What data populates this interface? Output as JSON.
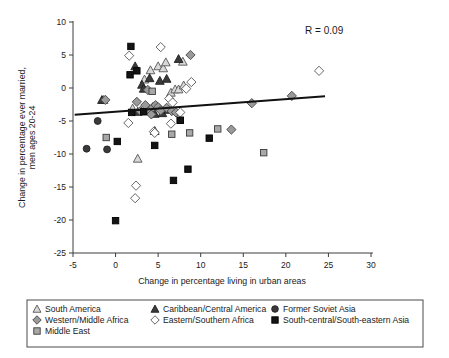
{
  "chart_data": {
    "type": "scatter",
    "title": "",
    "xlabel": "Change in percentage living in urban areas",
    "ylabel": "Change in percentage ever married, men ages 20-24",
    "xlim": [
      -5,
      30
    ],
    "ylim": [
      -25,
      10
    ],
    "xticks": [
      -5,
      0,
      5,
      10,
      15,
      20,
      25,
      30
    ],
    "yticks": [
      10,
      5,
      0,
      -5,
      -10,
      -15,
      -20,
      -25
    ],
    "xtick_labels": [
      "-5",
      "0",
      "5",
      "10",
      "15",
      "20",
      "25",
      "30"
    ],
    "ytick_labels": [
      "10",
      "5",
      "0",
      "-5",
      "-10",
      "-15",
      "-20",
      "-25"
    ],
    "grid": false,
    "legend_position": "below",
    "annotations": [
      {
        "text": "R = 0.09",
        "x": 24.5,
        "y": 8.2
      }
    ],
    "trendline": {
      "x_start": -4.8,
      "y_start": -4.05,
      "x_end": 24.6,
      "y_end": -1.25,
      "color": "#111111"
    },
    "series": [
      {
        "name": "South America",
        "marker": "triangle",
        "fill": "#d8d8d8",
        "edge": "#555555",
        "points": [
          {
            "x": -1.4,
            "y": -1.8
          },
          {
            "x": 2.0,
            "y": -3.1
          },
          {
            "x": 2.6,
            "y": -10.7
          },
          {
            "x": 3.0,
            "y": -3.5
          },
          {
            "x": 3.4,
            "y": 1.3
          },
          {
            "x": 4.1,
            "y": 2.7
          },
          {
            "x": 5.0,
            "y": 3.3
          },
          {
            "x": 5.6,
            "y": 3.0
          },
          {
            "x": 5.9,
            "y": 3.9
          },
          {
            "x": 6.5,
            "y": -0.7
          },
          {
            "x": 7.0,
            "y": -0.2
          },
          {
            "x": 7.4,
            "y": -0.2
          },
          {
            "x": 7.9,
            "y": 4.0
          },
          {
            "x": 8.0,
            "y": 0.4
          }
        ]
      },
      {
        "name": "Caribbean/Central America",
        "marker": "triangle",
        "fill": "#3a3a3a",
        "edge": "#222222",
        "points": [
          {
            "x": -1.6,
            "y": -1.8
          },
          {
            "x": 2.3,
            "y": 3.3
          },
          {
            "x": 2.6,
            "y": -3.6
          },
          {
            "x": 3.1,
            "y": 0.5
          },
          {
            "x": 3.3,
            "y": -0.1
          },
          {
            "x": 4.0,
            "y": 1.5
          },
          {
            "x": 4.6,
            "y": -3.9
          },
          {
            "x": 5.2,
            "y": 1.1
          },
          {
            "x": 5.5,
            "y": -3.8
          },
          {
            "x": 6.0,
            "y": 1.4
          },
          {
            "x": 6.2,
            "y": -3.3
          },
          {
            "x": 7.4,
            "y": 4.4
          },
          {
            "x": 4.6,
            "y": -6.5
          }
        ]
      },
      {
        "name": "Western/Middle Africa",
        "marker": "diamond",
        "fill": "#9a9a9a",
        "edge": "#444444",
        "points": [
          {
            "x": -1.2,
            "y": -1.8
          },
          {
            "x": 2.5,
            "y": -2.1
          },
          {
            "x": 2.9,
            "y": -3.5
          },
          {
            "x": 3.5,
            "y": -2.6
          },
          {
            "x": 3.8,
            "y": -0.3
          },
          {
            "x": 4.0,
            "y": -3.5
          },
          {
            "x": 4.2,
            "y": -4.0
          },
          {
            "x": 4.4,
            "y": -2.9
          },
          {
            "x": 4.7,
            "y": -2.6
          },
          {
            "x": 5.0,
            "y": -2.9
          },
          {
            "x": 5.3,
            "y": -3.4
          },
          {
            "x": 6.0,
            "y": -3.0
          },
          {
            "x": 6.6,
            "y": -3.5
          },
          {
            "x": 7.1,
            "y": -3.7
          },
          {
            "x": 8.8,
            "y": 5.0
          },
          {
            "x": 13.6,
            "y": -6.3
          },
          {
            "x": 16.0,
            "y": -2.3
          },
          {
            "x": 20.7,
            "y": -1.2
          }
        ]
      },
      {
        "name": "Eastern/Southern Africa",
        "marker": "diamond",
        "fill": "#ffffff",
        "edge": "#555555",
        "points": [
          {
            "x": 1.6,
            "y": 4.9
          },
          {
            "x": 1.5,
            "y": -5.3
          },
          {
            "x": 2.4,
            "y": -14.8
          },
          {
            "x": 2.3,
            "y": -16.7
          },
          {
            "x": 4.5,
            "y": -6.6
          },
          {
            "x": 4.6,
            "y": -6.8
          },
          {
            "x": 5.3,
            "y": 6.2
          },
          {
            "x": 6.3,
            "y": -1.6
          },
          {
            "x": 6.5,
            "y": -5.4
          },
          {
            "x": 6.7,
            "y": -2.2
          },
          {
            "x": 7.6,
            "y": -3.7
          },
          {
            "x": 8.3,
            "y": -0.1
          },
          {
            "x": 8.9,
            "y": 0.9
          },
          {
            "x": 23.9,
            "y": 2.6
          }
        ]
      },
      {
        "name": "Middle East",
        "marker": "square",
        "fill": "#a8a8a8",
        "edge": "#3a3a3a",
        "points": [
          {
            "x": -1.1,
            "y": -7.5
          },
          {
            "x": 4.3,
            "y": -0.5
          },
          {
            "x": 6.6,
            "y": -7.0
          },
          {
            "x": 7.6,
            "y": -4.9
          },
          {
            "x": 8.7,
            "y": -6.8
          },
          {
            "x": 12.0,
            "y": -6.2
          },
          {
            "x": 17.4,
            "y": -9.8
          }
        ]
      },
      {
        "name": "Former Soviet Asia",
        "marker": "circle",
        "fill": "#3a3a3a",
        "edge": "#222222",
        "points": [
          {
            "x": -3.4,
            "y": -9.2
          },
          {
            "x": -2.1,
            "y": -5.0
          },
          {
            "x": -1.0,
            "y": -9.3
          }
        ]
      },
      {
        "name": "South-central/South-eastern Asia",
        "marker": "square",
        "fill": "#141414",
        "edge": "#000000",
        "points": [
          {
            "x": 0.0,
            "y": -20.1
          },
          {
            "x": 0.2,
            "y": -8.1
          },
          {
            "x": 1.7,
            "y": 2.0
          },
          {
            "x": 1.8,
            "y": 6.3
          },
          {
            "x": 1.9,
            "y": -3.7
          },
          {
            "x": 2.5,
            "y": 2.6
          },
          {
            "x": 3.3,
            "y": -3.6
          },
          {
            "x": 4.6,
            "y": -8.7
          },
          {
            "x": 6.8,
            "y": -14.0
          },
          {
            "x": 7.6,
            "y": -4.9
          },
          {
            "x": 8.5,
            "y": -12.3
          },
          {
            "x": 11.0,
            "y": -7.6
          }
        ]
      }
    ]
  },
  "legend": {
    "columns": [
      [
        {
          "label": "South America",
          "marker": "triangle-light"
        },
        {
          "label": "Western/Middle Africa",
          "marker": "diamond-grey"
        },
        {
          "label": "Middle East",
          "marker": "square-grey"
        }
      ],
      [
        {
          "label": "Caribbean/Central America",
          "marker": "triangle-dark"
        },
        {
          "label": "Eastern/Southern Africa",
          "marker": "diamond-open"
        }
      ],
      [
        {
          "label": "Former Soviet Asia",
          "marker": "circle-dark"
        },
        {
          "label": "South-central/South-eastern Asia",
          "marker": "square-dark"
        }
      ]
    ]
  },
  "colors": {
    "axis": "#3c3c3c",
    "trend": "#111111",
    "text": "#1a1a1a",
    "light_fill": "#d8d8d8",
    "grey_fill": "#9a9a9a",
    "dark_fill": "#3a3a3a",
    "black_fill": "#141414",
    "open_fill": "#ffffff"
  }
}
